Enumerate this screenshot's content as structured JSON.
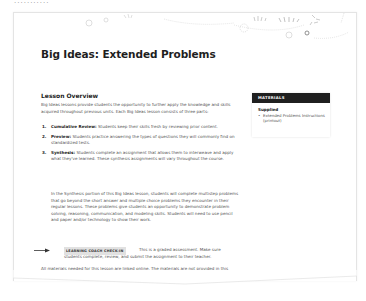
{
  "header": {
    "cut_text": "...........",
    "title": "Big Ideas: Extended Problems"
  },
  "overview": {
    "heading": "Lesson Overview",
    "intro": "Big Ideas lessons provide students the opportunity to further apply the knowledge and skills acquired throughout previous units. Each Big Ideas lesson consists of three parts:",
    "parts": [
      {
        "num": "1.",
        "label": "Cumulative Review:",
        "text": " Students keep their skills fresh by reviewing prior content."
      },
      {
        "num": "2.",
        "label": "Preview:",
        "text": " Students practice answering the types of questions they will commonly find on standardized tests."
      },
      {
        "num": "3.",
        "label": "Synthesis:",
        "text": " Students complete an assignment that allows them to interweave and apply what they've learned. These synthesis assignments will vary throughout the course."
      }
    ],
    "synthesis_detail": "In the Synthesis portion of this Big Ideas lesson, students will complete multistep problems that go beyond the short answer and multiple choice problems they encounter in their regular lessons. These problems give students an opportunity to demonstrate problem solving, reasoning, communication, and modeling skills. Students will need to use pencil and paper and/or technology to show their work.",
    "checkin": {
      "badge": "LEARNING COACH CHECK-IN",
      "line1": "This is a graded assessment. Make sure",
      "line2": "students complete, review, and submit the assignment to their teacher."
    },
    "closing": "All materials needed for this lesson are linked online. The materials are not provided in this Lesson Guide or in the Activity Book."
  },
  "materials": {
    "heading": "MATERIALS",
    "subheading": "Supplied",
    "items": [
      {
        "bullet": "•",
        "text": "Extended Problems Instructions (printout)"
      }
    ]
  },
  "colors": {
    "materials_header_bg": "#1f1f1f",
    "badge_bg": "#e1e1e1",
    "title": "#1e1e1e"
  }
}
